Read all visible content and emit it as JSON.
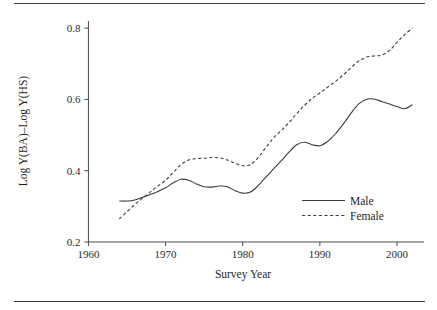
{
  "chart_data": {
    "type": "line",
    "title": "",
    "xlabel": "Survey Year",
    "ylabel": "Log Y(BA)–Log Y(HS)",
    "xlim": [
      1958,
      2003.5
    ],
    "ylim": [
      0.2,
      0.82
    ],
    "xticks": [
      1960,
      1970,
      1980,
      1990,
      2000
    ],
    "xticklabels": [
      "1960",
      "1970",
      "1980",
      "1990",
      "2000"
    ],
    "yticks": [
      0.2,
      0.4,
      0.6,
      0.8
    ],
    "yticklabels": [
      "0.2",
      "0.4",
      "0.6",
      "0.8"
    ],
    "grid": false,
    "legend_position": "center-right",
    "x": [
      1964,
      1965,
      1966,
      1967,
      1968,
      1969,
      1970,
      1971,
      1972,
      1973,
      1974,
      1975,
      1976,
      1977,
      1978,
      1979,
      1980,
      1981,
      1982,
      1983,
      1984,
      1985,
      1986,
      1987,
      1988,
      1989,
      1990,
      1991,
      1992,
      1993,
      1994,
      1995,
      1996,
      1997,
      1998,
      1999,
      2000,
      2001,
      2002
    ],
    "series": [
      {
        "name": "Male",
        "style": "solid",
        "color": "#3c3c3c",
        "values": [
          0.315,
          0.315,
          0.318,
          0.325,
          0.333,
          0.342,
          0.352,
          0.366,
          0.376,
          0.373,
          0.363,
          0.355,
          0.354,
          0.357,
          0.355,
          0.344,
          0.337,
          0.34,
          0.358,
          0.382,
          0.405,
          0.428,
          0.452,
          0.473,
          0.48,
          0.473,
          0.47,
          0.482,
          0.503,
          0.53,
          0.56,
          0.587,
          0.6,
          0.601,
          0.594,
          0.587,
          0.58,
          0.574,
          0.585
        ]
      },
      {
        "name": "Female",
        "style": "dashed",
        "color": "#3c3c3c",
        "values": [
          0.265,
          0.285,
          0.305,
          0.323,
          0.34,
          0.357,
          0.373,
          0.395,
          0.417,
          0.43,
          0.434,
          0.435,
          0.437,
          0.436,
          0.43,
          0.421,
          0.414,
          0.417,
          0.437,
          0.465,
          0.492,
          0.513,
          0.535,
          0.56,
          0.583,
          0.603,
          0.618,
          0.634,
          0.65,
          0.668,
          0.688,
          0.707,
          0.718,
          0.722,
          0.724,
          0.737,
          0.76,
          0.782,
          0.8
        ]
      }
    ]
  },
  "legend": {
    "entries": [
      {
        "label": "Male",
        "style": "solid"
      },
      {
        "label": "Female",
        "style": "dashed"
      }
    ]
  }
}
